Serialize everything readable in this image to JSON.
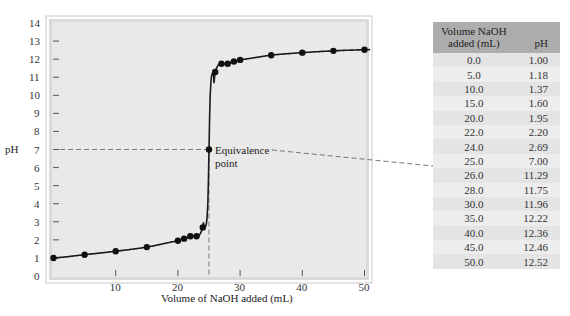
{
  "chart_data": {
    "type": "line",
    "title": "",
    "xlabel": "Volume of NaOH added (mL)",
    "ylabel": "pH",
    "xlim": [
      0,
      55
    ],
    "ylim": [
      0,
      14
    ],
    "x_ticks": [
      10,
      20,
      30,
      40,
      50
    ],
    "y_ticks": [
      0,
      1,
      2,
      3,
      4,
      5,
      6,
      7,
      8,
      9,
      10,
      11,
      12,
      13,
      14
    ],
    "grid": false,
    "series": [
      {
        "name": "Titration curve",
        "x": [
          0.0,
          5.0,
          10.0,
          15.0,
          20.0,
          22.0,
          24.0,
          25.0,
          26.0,
          28.0,
          30.0,
          35.0,
          40.0,
          45.0,
          50.0
        ],
        "y": [
          1.0,
          1.18,
          1.37,
          1.6,
          1.95,
          2.2,
          2.69,
          7.0,
          11.29,
          11.75,
          11.96,
          12.22,
          12.36,
          12.46,
          12.52
        ]
      }
    ],
    "annotations": [
      {
        "text": "Equivalence point",
        "x": 25.0,
        "y": 7.0
      }
    ]
  },
  "table": {
    "headers": {
      "volume": "Volume NaOH added (mL)",
      "volume_line1": "Volume NaOH",
      "volume_line2": "added (mL)",
      "ph": "pH"
    },
    "rows": [
      {
        "volume": "0.0",
        "ph": "1.00"
      },
      {
        "volume": "5.0",
        "ph": "1.18"
      },
      {
        "volume": "10.0",
        "ph": "1.37"
      },
      {
        "volume": "15.0",
        "ph": "1.60"
      },
      {
        "volume": "20.0",
        "ph": "1.95"
      },
      {
        "volume": "22.0",
        "ph": "2.20"
      },
      {
        "volume": "24.0",
        "ph": "2.69"
      },
      {
        "volume": "25.0",
        "ph": "7.00"
      },
      {
        "volume": "26.0",
        "ph": "11.29"
      },
      {
        "volume": "28.0",
        "ph": "11.75"
      },
      {
        "volume": "30.0",
        "ph": "11.96"
      },
      {
        "volume": "35.0",
        "ph": "12.22"
      },
      {
        "volume": "40.0",
        "ph": "12.36"
      },
      {
        "volume": "45.0",
        "ph": "12.46"
      },
      {
        "volume": "50.0",
        "ph": "12.52"
      }
    ]
  },
  "labels": {
    "ylabel": "pH",
    "xlabel": "Volume of NaOH added (mL)",
    "annotation_line1": "Equivalence",
    "annotation_line2": "point"
  },
  "colors": {
    "plot_bg": "#e8e8e8",
    "frame": "#c9c9c9",
    "curve": "#1a1a1a",
    "dashed": "#777777",
    "table_header": "#adadad"
  }
}
